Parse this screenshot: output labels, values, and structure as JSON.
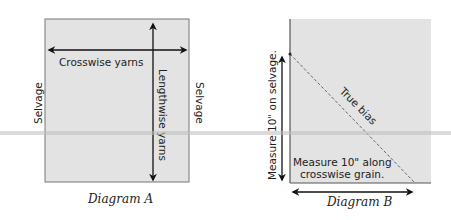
{
  "diagram_a": {
    "caption": "Diagram A",
    "crosswise_label": "Crosswise yarns",
    "lengthwise_label": "Lengthwise yarns",
    "left_selvage": "Selvage",
    "right_selvage": "Selvage"
  },
  "diagram_b": {
    "caption": "Diagram B",
    "vertical_label": "Measure 10\"  on selvage.",
    "bias_label": "True bias",
    "horizontal_label_line1": "Measure 10\" along",
    "horizontal_label_line2": "crosswise grain."
  },
  "colors": {
    "fabric": "#e3e3e3",
    "border": "#6a6a6a",
    "arrow": "#111111",
    "band": "#c8c8c8"
  }
}
